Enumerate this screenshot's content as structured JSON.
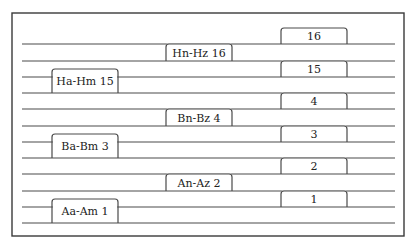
{
  "diagram": {
    "frame": {
      "x": 12,
      "y": 13,
      "width": 392,
      "height": 223
    },
    "line_x_start": 22,
    "line_x_end": 395,
    "lines_y": [
      44,
      61,
      77,
      93,
      109,
      126,
      142,
      158,
      174,
      191,
      207,
      223
    ],
    "boxes": [
      {
        "label": "16",
        "x1": 281,
        "x2": 347,
        "top": 28,
        "bottom": 44
      },
      {
        "label": "Hn-Hz 16",
        "x1": 166,
        "x2": 232,
        "top": 44,
        "bottom": 61
      },
      {
        "label": "15",
        "x1": 281,
        "x2": 347,
        "top": 61,
        "bottom": 77
      },
      {
        "label": "Ha-Hm 15",
        "x1": 52,
        "x2": 118,
        "top": 69,
        "bottom": 93
      },
      {
        "label": "4",
        "x1": 281,
        "x2": 347,
        "top": 93,
        "bottom": 109
      },
      {
        "label": "Bn-Bz 4",
        "x1": 166,
        "x2": 232,
        "top": 109,
        "bottom": 126
      },
      {
        "label": "3",
        "x1": 281,
        "x2": 347,
        "top": 126,
        "bottom": 142
      },
      {
        "label": "Ba-Bm 3",
        "x1": 52,
        "x2": 118,
        "top": 134,
        "bottom": 158
      },
      {
        "label": "2",
        "x1": 281,
        "x2": 347,
        "top": 158,
        "bottom": 174
      },
      {
        "label": "An-Az 2",
        "x1": 166,
        "x2": 232,
        "top": 174,
        "bottom": 191
      },
      {
        "label": "1",
        "x1": 281,
        "x2": 347,
        "top": 191,
        "bottom": 207
      },
      {
        "label": "Aa-Am 1",
        "x1": 52,
        "x2": 118,
        "top": 199,
        "bottom": 223
      }
    ]
  }
}
